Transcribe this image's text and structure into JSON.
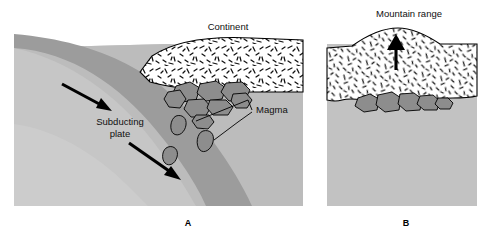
{
  "figure": {
    "title_visible": false,
    "panels": [
      {
        "id": "A",
        "panel_label": "A",
        "labels": {
          "continent": "Continent",
          "subducting_plate_line1": "Subducting",
          "subducting_plate_line2": "plate",
          "magma": "Magma"
        },
        "arrows": [
          {
            "name": "subduction-arrow-upper",
            "direction": "down-right"
          },
          {
            "name": "subduction-arrow-lower",
            "direction": "down-right"
          }
        ]
      },
      {
        "id": "B",
        "panel_label": "B",
        "labels": {
          "mountain_range": "Mountain range"
        },
        "arrows": [
          {
            "name": "uplift-arrow",
            "direction": "up"
          }
        ]
      }
    ]
  },
  "colors": {
    "background": "#ffffff",
    "mantle_light": "#c9c9c9",
    "mantle_mid": "#bdbdbd",
    "slab_dark": "#9a9a9a",
    "crust_white": "#ffffff",
    "magma_gray": "#8f8f8f",
    "outline": "#000000",
    "text": "#101010"
  }
}
